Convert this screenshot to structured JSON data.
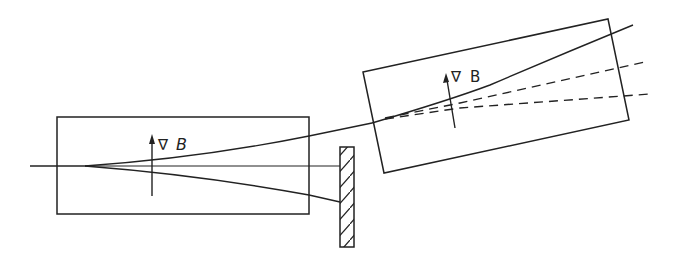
{
  "diagram": {
    "type": "stern-gerlach-sequential",
    "magnet1": {
      "label_symbol": "∇",
      "label_var": "B",
      "gradient_arrow": "up"
    },
    "magnet2": {
      "label_symbol": "∇",
      "label_var": "B",
      "gradient_arrow": "up",
      "rotated": true
    },
    "blocker": {
      "style": "hatched"
    },
    "beams": {
      "incoming": "single",
      "split_in_magnet1": [
        "upper",
        "lower"
      ],
      "lower_beam": "blocked",
      "upper_split_in_magnet2": [
        "solid-upper",
        "dashed-middle",
        "dashed-lower"
      ]
    },
    "colors": {
      "stroke": "#222222",
      "background": "#ffffff"
    }
  }
}
